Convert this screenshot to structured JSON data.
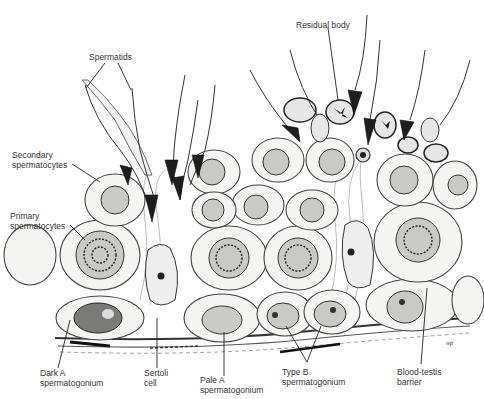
{
  "diagram": {
    "labels": {
      "spermatids": "Spermatids",
      "residual_body": "Residual body",
      "secondary_1": "Secondary",
      "secondary_2": "spermatocytes",
      "primary_1": "Primary",
      "primary_2": "spermatocytes",
      "dark_a_1": "Dark A",
      "dark_a_2": "spermatogonium",
      "sertoli_1": "Sertoli",
      "sertoli_2": "cell",
      "pale_a_1": "Pale A",
      "pale_a_2": "spermatogonium",
      "type_b_1": "Type B",
      "type_b_2": "spermatogonium",
      "btb_1": "Blood-testis",
      "btb_2": "barrier"
    },
    "signature": "wp"
  }
}
